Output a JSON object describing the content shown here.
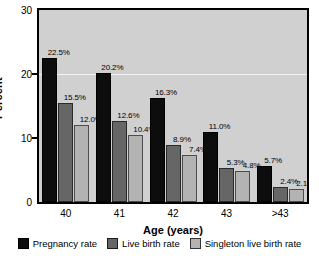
{
  "chart_data": {
    "type": "bar",
    "title": "",
    "xlabel": "Age (years)",
    "ylabel": "Percent",
    "categories": [
      "40",
      "41",
      "42",
      "43",
      ">43"
    ],
    "ylim": [
      0,
      30
    ],
    "yticks": [
      0,
      10,
      20,
      30
    ],
    "ytick_labels": [
      "0",
      "10",
      "20",
      "30"
    ],
    "grid": false,
    "legend_position": "bottom",
    "series": [
      {
        "name": "Pregnancy rate",
        "color": "#0d0d0d",
        "values": [
          22.5,
          20.2,
          16.3,
          11.0,
          5.7
        ],
        "labels": [
          "22.5%",
          "20.2%",
          "16.3%",
          "11.0%",
          "5.7%"
        ]
      },
      {
        "name": "Live birth rate",
        "color": "#666666",
        "values": [
          15.5,
          12.6,
          8.9,
          5.3,
          2.4
        ],
        "labels": [
          "15.5%",
          "12.6%",
          "8.9%",
          "5.3%",
          "2.4%"
        ]
      },
      {
        "name": "Singleton live birth rate",
        "color": "#b3b3b3",
        "values": [
          12.0,
          10.4,
          7.4,
          4.8,
          2.1
        ],
        "labels": [
          "12.0%",
          "10.4%",
          "7.4%",
          "4.8%",
          "2.1%"
        ]
      }
    ]
  },
  "colors": {
    "plot_background": "#d0d0d0",
    "axis": "#000000",
    "gridline": "#f2f2f2",
    "page_background": "#ffffff"
  }
}
